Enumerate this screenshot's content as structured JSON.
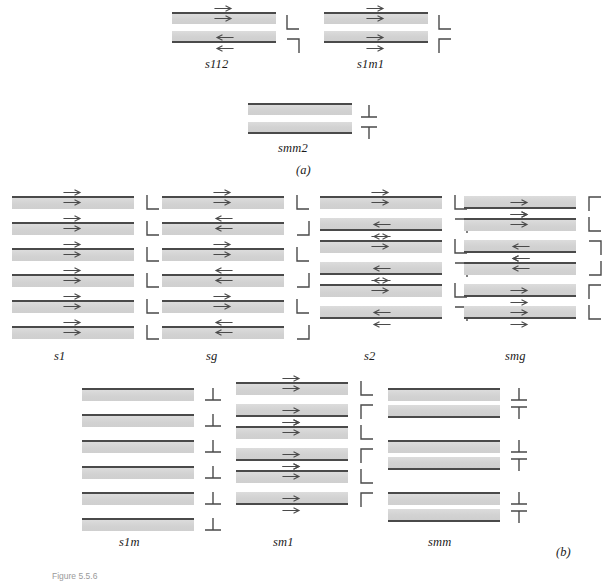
{
  "figure": {
    "caption": "Figure 5.5.6",
    "part_a_label": "(a)",
    "part_b_label": "(b)",
    "stroke_color": "#4a4a4a",
    "band_fill_color": "#d5d5d5",
    "background_color": "#ffffff"
  },
  "part_a": {
    "label": "(a)",
    "groups": [
      {
        "name": "s112",
        "x": 172,
        "y": 12,
        "band_width": 104,
        "band_height": 12,
        "gap": 7,
        "sym_x": 112,
        "sym_width": 18,
        "bands": [
          {
            "rule": "line-top",
            "arrow": "right",
            "arrow_pos": "above"
          },
          {
            "rule": "line-bottom",
            "arrow": "right",
            "arrow_pos": "inside"
          },
          {
            "rule": "line-bottom",
            "arrow": "left",
            "arrow_pos": "inside"
          },
          {
            "rule": "line-none",
            "arrow": "left",
            "arrow_pos": "below"
          }
        ],
        "band_rows": [
          {
            "rule": "line-top-bottom",
            "arrow_above": "right",
            "arrow_inside": "right"
          },
          {
            "rule": "line-bottom",
            "arrow_inside": "left",
            "arrow_below": "left"
          }
        ],
        "symbols": [
          {
            "glyph": "corner-bl",
            "y": 2
          },
          {
            "glyph": "corner-tr",
            "y": 24
          }
        ]
      },
      {
        "name": "s1m1",
        "x": 324,
        "y": 12,
        "band_width": 104,
        "band_height": 12,
        "gap": 7,
        "sym_x": 112,
        "sym_width": 18,
        "band_rows": [
          {
            "rule": "line-top-bottom",
            "arrow_above": "right",
            "arrow_inside": "right"
          },
          {
            "rule": "line-bottom",
            "arrow_inside": "right",
            "arrow_below": "right"
          }
        ],
        "symbols": [
          {
            "glyph": "corner-bl",
            "y": 2
          },
          {
            "glyph": "corner-tl",
            "y": 24
          }
        ]
      },
      {
        "name": "smm2",
        "x": 248,
        "y": 103,
        "band_width": 104,
        "band_height": 12,
        "gap": 7,
        "sym_x": 112,
        "sym_width": 18,
        "band_rows": [
          {
            "rule": "line-top-bottom",
            "arrow_above": "none",
            "arrow_inside": "none"
          },
          {
            "rule": "line-bottom",
            "arrow_inside": "none",
            "arrow_below": "none"
          }
        ],
        "symbols": [
          {
            "glyph": "perp-down",
            "y": 0
          },
          {
            "glyph": "perp-up",
            "y": 20
          }
        ]
      }
    ]
  },
  "part_b": {
    "label": "(b)",
    "row1": [
      {
        "name": "s1",
        "x": 12,
        "y": 196,
        "band_width": 122,
        "band_height": 13,
        "gap": 13,
        "sym_x": 132,
        "bands": [
          {
            "rule": "line-top",
            "arrow_above": "right",
            "arrow_inside": "right",
            "symbol": "corner-bl"
          },
          {
            "rule": "line-top",
            "arrow_above": "right",
            "arrow_inside": "right",
            "symbol": "corner-bl"
          },
          {
            "rule": "line-top",
            "arrow_above": "right",
            "arrow_inside": "right",
            "symbol": "corner-bl"
          },
          {
            "rule": "line-top",
            "arrow_above": "right",
            "arrow_inside": "right",
            "symbol": "corner-bl"
          },
          {
            "rule": "line-top",
            "arrow_above": "right",
            "arrow_inside": "right",
            "symbol": "corner-bl"
          },
          {
            "rule": "line-top",
            "arrow_above": "right",
            "arrow_inside": "right",
            "symbol": "corner-bl"
          }
        ]
      },
      {
        "name": "sg",
        "x": 162,
        "y": 196,
        "band_width": 122,
        "band_height": 13,
        "gap": 13,
        "sym_x": 132,
        "bands": [
          {
            "rule": "line-top",
            "arrow_above": "right",
            "arrow_inside": "right",
            "symbol": "corner-bl"
          },
          {
            "rule": "line-top",
            "arrow_above": "left",
            "arrow_inside": "left",
            "symbol": "corner-br"
          },
          {
            "rule": "line-top",
            "arrow_above": "right",
            "arrow_inside": "right",
            "symbol": "corner-bl"
          },
          {
            "rule": "line-top",
            "arrow_above": "left",
            "arrow_inside": "left",
            "symbol": "corner-br"
          },
          {
            "rule": "line-top",
            "arrow_above": "right",
            "arrow_inside": "right",
            "symbol": "corner-bl"
          },
          {
            "rule": "line-top",
            "arrow_above": "left",
            "arrow_inside": "left",
            "symbol": "corner-br"
          }
        ]
      },
      {
        "name": "s2",
        "x": 320,
        "y": 196,
        "band_width": 122,
        "band_height": 13,
        "gap": 9,
        "sym_x": 132,
        "bands": [
          {
            "rule": "line-top",
            "arrow_above": "right",
            "arrow_inside": "right",
            "symbol": "corner-bl"
          },
          {
            "rule": "line-bottom",
            "arrow_inside": "left",
            "arrow_below": "left",
            "symbol": "corner-tr"
          },
          {
            "rule": "line-top",
            "arrow_above": "right",
            "arrow_inside": "right",
            "symbol": "corner-bl"
          },
          {
            "rule": "line-bottom",
            "arrow_inside": "left",
            "arrow_below": "left",
            "symbol": "corner-tr"
          },
          {
            "rule": "line-top",
            "arrow_above": "right",
            "arrow_inside": "right",
            "symbol": "corner-bl"
          },
          {
            "rule": "line-bottom",
            "arrow_inside": "left",
            "arrow_below": "left",
            "symbol": "corner-tr"
          }
        ]
      },
      {
        "name": "smg",
        "x": 464,
        "y": 196,
        "band_width": 112,
        "band_height": 13,
        "gap": 9,
        "sym_x": 122,
        "bands": [
          {
            "rule": "line-bottom",
            "arrow_inside": "right",
            "arrow_below": "right",
            "symbol": "corner-tl"
          },
          {
            "rule": "line-top",
            "arrow_above": "right",
            "arrow_inside": "right",
            "symbol": "corner-bl"
          },
          {
            "rule": "line-bottom",
            "arrow_inside": "left",
            "arrow_below": "left",
            "symbol": "corner-tr"
          },
          {
            "rule": "line-top",
            "arrow_above": "left",
            "arrow_inside": "left",
            "symbol": "corner-br"
          },
          {
            "rule": "line-bottom",
            "arrow_inside": "right",
            "arrow_below": "right",
            "symbol": "corner-tl"
          },
          {
            "rule": "line-bottom",
            "arrow_inside": "right",
            "arrow_below": "right",
            "symbol": "corner-bl"
          }
        ]
      }
    ],
    "row2": [
      {
        "name": "s1m",
        "x": 82,
        "y": 388,
        "band_width": 112,
        "band_height": 13,
        "gap": 13,
        "sym_x": 122,
        "bands": [
          {
            "rule": "line-top",
            "arrow_above": "none",
            "arrow_inside": "none",
            "symbol": "perp-down"
          },
          {
            "rule": "line-top",
            "arrow_above": "none",
            "arrow_inside": "none",
            "symbol": "perp-down"
          },
          {
            "rule": "line-top",
            "arrow_above": "none",
            "arrow_inside": "none",
            "symbol": "perp-down"
          },
          {
            "rule": "line-top",
            "arrow_above": "none",
            "arrow_inside": "none",
            "symbol": "perp-down"
          },
          {
            "rule": "line-top",
            "arrow_above": "none",
            "arrow_inside": "none",
            "symbol": "perp-down"
          },
          {
            "rule": "line-top",
            "arrow_above": "none",
            "arrow_inside": "none",
            "symbol": "perp-down"
          }
        ]
      },
      {
        "name": "sm1",
        "x": 236,
        "y": 382,
        "band_width": 112,
        "band_height": 13,
        "gap": 9,
        "sym_x": 122,
        "bands": [
          {
            "rule": "line-top",
            "arrow_above": "right",
            "arrow_inside": "right",
            "symbol": "corner-bl"
          },
          {
            "rule": "line-bottom",
            "arrow_inside": "right",
            "arrow_below": "right",
            "symbol": "corner-tl"
          },
          {
            "rule": "line-top",
            "arrow_above": "right",
            "arrow_inside": "right",
            "symbol": "corner-bl"
          },
          {
            "rule": "line-bottom",
            "arrow_inside": "right",
            "arrow_below": "right",
            "symbol": "corner-tl"
          },
          {
            "rule": "line-top",
            "arrow_above": "right",
            "arrow_inside": "right",
            "symbol": "corner-bl"
          },
          {
            "rule": "line-bottom",
            "arrow_inside": "right",
            "arrow_below": "right",
            "symbol": "corner-tl"
          }
        ]
      },
      {
        "name": "smm",
        "x": 388,
        "y": 388,
        "band_width": 112,
        "band_height": 13,
        "gap": 4,
        "pair_gap": 22,
        "sym_x": 122,
        "bands": [
          {
            "rule": "line-top",
            "arrow_above": "none",
            "arrow_inside": "none",
            "symbol": "perp-down"
          },
          {
            "rule": "line-bottom",
            "arrow_inside": "none",
            "arrow_below": "none",
            "symbol": "perp-up"
          },
          {
            "rule": "line-top",
            "arrow_above": "none",
            "arrow_inside": "none",
            "symbol": "perp-down"
          },
          {
            "rule": "line-bottom",
            "arrow_inside": "none",
            "arrow_below": "none",
            "symbol": "perp-up"
          },
          {
            "rule": "line-top",
            "arrow_above": "none",
            "arrow_inside": "none",
            "symbol": "perp-down"
          },
          {
            "rule": "line-bottom",
            "arrow_inside": "none",
            "arrow_below": "none",
            "symbol": "perp-up"
          }
        ]
      }
    ]
  }
}
